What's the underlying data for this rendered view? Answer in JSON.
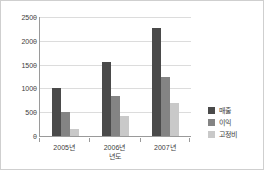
{
  "chart_data": {
    "type": "bar",
    "title": "",
    "subtitle": "",
    "xlabel": "년도",
    "ylabel": "",
    "categories": [
      "2005년",
      "2006년",
      "2007년"
    ],
    "series": [
      {
        "name": "매출",
        "color": "#4a4a4a",
        "values": [
          1000,
          1550,
          2270
        ]
      },
      {
        "name": "이익",
        "color": "#848484",
        "values": [
          500,
          850,
          1240
        ]
      },
      {
        "name": "고정비",
        "color": "#c9c9c9",
        "values": [
          150,
          430,
          700
        ]
      }
    ],
    "ylim": [
      0,
      2500
    ],
    "ytick_values": [
      0,
      500,
      1000,
      1500,
      2000,
      2500
    ],
    "ytick_labels": [
      "0",
      "500",
      "1000",
      "1500",
      "2000",
      "2500"
    ],
    "grid": true,
    "grid_axis": "y",
    "legend_position": "right",
    "plot_background": "#ffffff"
  },
  "frame": {
    "border_color": "#cfcfcf",
    "axis_color": "#9a9a9a",
    "gridline_color": "#dcdcdc",
    "text_color": "#3d3d3d"
  }
}
